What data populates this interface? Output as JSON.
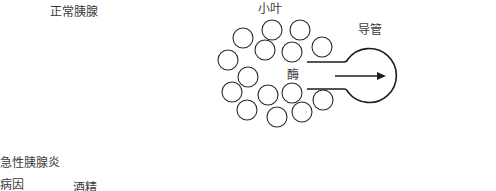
{
  "title_normal": "正常胰腺",
  "diagram": {
    "lobule_label": "小叶",
    "duct_label": "导管",
    "enzyme_label": "酶",
    "colors": {
      "stroke": "#2a2a2a",
      "text": "#3a3a3a",
      "background": "#ffffff"
    }
  },
  "section_acute": {
    "heading": "急性胰腺炎",
    "cause_label": "病因",
    "cause_value": "酒精"
  }
}
